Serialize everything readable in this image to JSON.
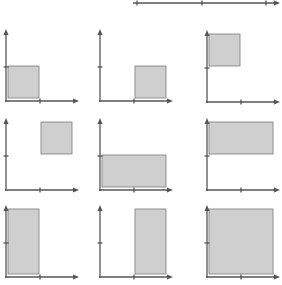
{
  "diagram": {
    "colors": {
      "axis": "#555555",
      "rect_fill": "#cfcfcf",
      "rect_stroke": "#7a7a7a",
      "background": "#ffffff"
    },
    "top_axis": {
      "x1": 133,
      "x2": 280,
      "y": 3,
      "ticks": [
        137,
        202,
        266
      ]
    },
    "unit_px": 33,
    "panels": [
      {
        "id": 1,
        "origin": [
          6,
          101
        ],
        "x_range": [
          0,
          1
        ],
        "y_range": [
          0,
          1
        ]
      },
      {
        "id": 2,
        "origin": [
          100,
          101
        ],
        "x_range": [
          1,
          2
        ],
        "y_range": [
          0,
          1
        ]
      },
      {
        "id": 3,
        "origin": [
          207,
          102
        ],
        "x_range": [
          0,
          1
        ],
        "y_range": [
          1,
          2
        ]
      },
      {
        "id": 4,
        "origin": [
          6,
          190
        ],
        "x_range": [
          1,
          2
        ],
        "y_range": [
          1,
          2
        ]
      },
      {
        "id": 5,
        "origin": [
          100,
          190
        ],
        "x_range": [
          0,
          2
        ],
        "y_range": [
          0,
          1
        ]
      },
      {
        "id": 6,
        "origin": [
          207,
          190
        ],
        "x_range": [
          0,
          2
        ],
        "y_range": [
          1,
          2
        ]
      },
      {
        "id": 7,
        "origin": [
          6,
          277
        ],
        "x_range": [
          0,
          1
        ],
        "y_range": [
          0,
          2
        ]
      },
      {
        "id": 8,
        "origin": [
          100,
          277
        ],
        "x_range": [
          1,
          2
        ],
        "y_range": [
          0,
          2
        ]
      },
      {
        "id": 9,
        "origin": [
          207,
          277
        ],
        "x_range": [
          0,
          2
        ],
        "y_range": [
          0,
          2
        ]
      }
    ]
  }
}
